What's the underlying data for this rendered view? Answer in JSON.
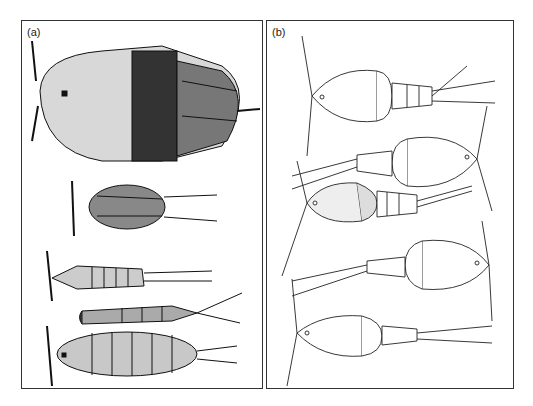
{
  "figure": {
    "panels": [
      {
        "label": "(a)",
        "description": "Five copepod specimens drawn in stippled/shaded ink style, oriented horizontally with heads to the left"
      },
      {
        "label": "(b)",
        "description": "Five copepod specimens drawn in clean outline style, alternating orientation"
      }
    ]
  }
}
